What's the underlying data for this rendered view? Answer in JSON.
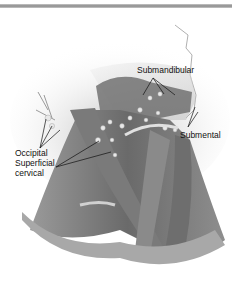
{
  "figure": {
    "type": "anatomical-illustration",
    "labels": {
      "submandibular": "Submandibular",
      "submental": "Submental",
      "occipital": "Occipital",
      "superficial_cervical_line1": "Superficial",
      "superficial_cervical_line2": "cervical"
    }
  },
  "colors": {
    "bar": "#8a8a8a",
    "muscle_dark": "#5a5a5a",
    "muscle_mid": "#8c8c8c",
    "skin_light": "#d8d8d8",
    "node": "#e6e6e6",
    "leader_line": "#111111"
  }
}
